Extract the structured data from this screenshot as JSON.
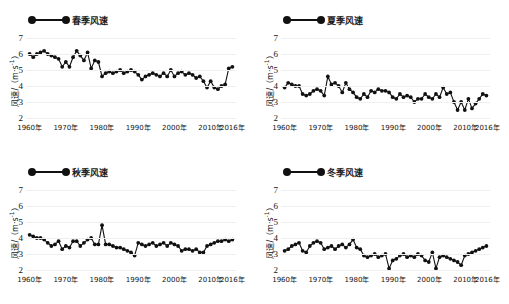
{
  "figure": {
    "background": "#ffffff",
    "series_color": "#111111",
    "panel_count": 4
  },
  "axis": {
    "ylabel": "风速/（m·s",
    "ylabel_sup": "-1",
    "ylabel_tail": "）",
    "yticks": [
      "7",
      "6",
      "5",
      "4",
      "3",
      "2"
    ],
    "ylim": [
      2,
      7
    ],
    "xticks": [
      "1960年",
      "1970年",
      "1980年",
      "1990年",
      "2000年",
      "2010年",
      "2016年"
    ],
    "xtick_values": [
      1960,
      1970,
      1980,
      1990,
      2000,
      2010,
      2016
    ],
    "xlim": [
      1959,
      2017
    ]
  },
  "panels": [
    {
      "id": "spring",
      "legend": "春季风速"
    },
    {
      "id": "summer",
      "legend": "夏季风速"
    },
    {
      "id": "autumn",
      "legend": "秋季风速"
    },
    {
      "id": "winter",
      "legend": "冬季风速"
    }
  ],
  "chart_data": [
    {
      "type": "line",
      "title": "春季风速",
      "xlabel": "",
      "ylabel": "风速/（m·s-1）",
      "ylim": [
        2,
        7
      ],
      "xlim": [
        1959,
        2017
      ],
      "grid": true,
      "legend": "春季风速",
      "marker": "filled-circle",
      "x": [
        1960,
        1961,
        1962,
        1963,
        1964,
        1965,
        1966,
        1967,
        1968,
        1969,
        1970,
        1971,
        1972,
        1973,
        1974,
        1975,
        1976,
        1977,
        1978,
        1979,
        1980,
        1981,
        1982,
        1983,
        1984,
        1985,
        1986,
        1987,
        1988,
        1989,
        1990,
        1991,
        1992,
        1993,
        1994,
        1995,
        1996,
        1997,
        1998,
        1999,
        2000,
        2001,
        2002,
        2003,
        2004,
        2005,
        2006,
        2007,
        2008,
        2009,
        2010,
        2011,
        2012,
        2013,
        2014,
        2015,
        2016
      ],
      "values": [
        6.0,
        5.8,
        6.0,
        6.1,
        6.2,
        6.0,
        5.9,
        5.8,
        5.7,
        5.2,
        5.5,
        5.2,
        5.8,
        6.2,
        5.9,
        5.6,
        6.1,
        5.1,
        5.6,
        5.5,
        4.6,
        4.8,
        4.9,
        4.8,
        4.9,
        5.0,
        4.8,
        4.9,
        5.0,
        4.9,
        4.7,
        4.4,
        4.6,
        4.7,
        4.8,
        4.7,
        4.6,
        4.8,
        4.6,
        5.0,
        4.6,
        4.8,
        4.9,
        4.7,
        4.8,
        4.7,
        4.5,
        4.6,
        4.3,
        3.9,
        4.3,
        3.9,
        3.8,
        4.0,
        4.1,
        5.1,
        5.2
      ]
    },
    {
      "type": "line",
      "title": "夏季风速",
      "xlabel": "",
      "ylabel": "风速/（m·s-1）",
      "ylim": [
        2,
        7
      ],
      "xlim": [
        1959,
        2017
      ],
      "grid": true,
      "legend": "夏季风速",
      "marker": "filled-circle",
      "x": [
        1960,
        1961,
        1962,
        1963,
        1964,
        1965,
        1966,
        1967,
        1968,
        1969,
        1970,
        1971,
        1972,
        1973,
        1974,
        1975,
        1976,
        1977,
        1978,
        1979,
        1980,
        1981,
        1982,
        1983,
        1984,
        1985,
        1986,
        1987,
        1988,
        1989,
        1990,
        1991,
        1992,
        1993,
        1994,
        1995,
        1996,
        1997,
        1998,
        1999,
        2000,
        2001,
        2002,
        2003,
        2004,
        2005,
        2006,
        2007,
        2008,
        2009,
        2010,
        2011,
        2012,
        2013,
        2014,
        2015,
        2016
      ],
      "values": [
        3.9,
        4.2,
        4.1,
        4.0,
        4.0,
        3.5,
        3.4,
        3.5,
        3.7,
        3.8,
        3.7,
        3.4,
        4.6,
        4.1,
        4.2,
        4.0,
        3.6,
        4.2,
        3.8,
        3.6,
        3.3,
        3.2,
        3.5,
        3.3,
        3.7,
        3.6,
        3.8,
        3.7,
        3.7,
        3.6,
        3.3,
        3.2,
        3.5,
        3.3,
        3.4,
        3.3,
        3.0,
        3.2,
        3.2,
        3.5,
        3.3,
        3.2,
        3.5,
        3.3,
        3.9,
        3.5,
        3.6,
        3.0,
        2.5,
        3.0,
        2.5,
        3.2,
        2.6,
        2.9,
        3.2,
        3.5,
        3.4
      ]
    },
    {
      "type": "line",
      "title": "秋季风速",
      "xlabel": "",
      "ylabel": "风速/（m·s-1）",
      "ylim": [
        2,
        7
      ],
      "xlim": [
        1959,
        2017
      ],
      "grid": true,
      "legend": "秋季风速",
      "marker": "filled-circle",
      "x": [
        1960,
        1961,
        1962,
        1963,
        1964,
        1965,
        1966,
        1967,
        1968,
        1969,
        1970,
        1971,
        1972,
        1973,
        1974,
        1975,
        1976,
        1977,
        1978,
        1979,
        1980,
        1981,
        1982,
        1983,
        1984,
        1985,
        1986,
        1987,
        1988,
        1989,
        1990,
        1991,
        1992,
        1993,
        1994,
        1995,
        1996,
        1997,
        1998,
        1999,
        2000,
        2001,
        2002,
        2003,
        2004,
        2005,
        2006,
        2007,
        2008,
        2009,
        2010,
        2011,
        2012,
        2013,
        2014,
        2015,
        2016
      ],
      "values": [
        4.2,
        4.1,
        4.0,
        4.0,
        3.9,
        3.7,
        3.5,
        3.6,
        3.8,
        3.3,
        3.5,
        3.4,
        3.8,
        3.8,
        3.5,
        3.7,
        3.9,
        4.0,
        3.6,
        3.6,
        4.8,
        3.6,
        3.6,
        3.5,
        3.4,
        3.4,
        3.3,
        3.2,
        3.1,
        2.9,
        3.7,
        3.6,
        3.5,
        3.6,
        3.7,
        3.5,
        3.6,
        3.7,
        3.5,
        3.7,
        3.6,
        3.5,
        3.2,
        3.3,
        3.3,
        3.2,
        3.3,
        3.1,
        3.1,
        3.5,
        3.6,
        3.7,
        3.8,
        3.8,
        3.9,
        3.8,
        3.9
      ]
    },
    {
      "type": "line",
      "title": "冬季风速",
      "xlabel": "",
      "ylabel": "风速/（m·s-1）",
      "ylim": [
        2,
        7
      ],
      "xlim": [
        1959,
        2017
      ],
      "grid": true,
      "legend": "冬季风速",
      "marker": "filled-circle",
      "x": [
        1960,
        1961,
        1962,
        1963,
        1964,
        1965,
        1966,
        1967,
        1968,
        1969,
        1970,
        1971,
        1972,
        1973,
        1974,
        1975,
        1976,
        1977,
        1978,
        1979,
        1980,
        1981,
        1982,
        1983,
        1984,
        1985,
        1986,
        1987,
        1988,
        1989,
        1990,
        1991,
        1992,
        1993,
        1994,
        1995,
        1996,
        1997,
        1998,
        1999,
        2000,
        2001,
        2002,
        2003,
        2004,
        2005,
        2006,
        2007,
        2008,
        2009,
        2010,
        2011,
        2012,
        2013,
        2014,
        2015,
        2016
      ],
      "values": [
        3.2,
        3.3,
        3.5,
        3.6,
        3.7,
        3.2,
        3.1,
        3.5,
        3.7,
        3.8,
        3.7,
        3.3,
        3.4,
        3.5,
        3.3,
        3.5,
        3.6,
        3.4,
        3.6,
        3.9,
        3.4,
        3.3,
        2.9,
        2.8,
        2.9,
        3.0,
        2.8,
        2.9,
        3.0,
        2.1,
        2.6,
        2.7,
        2.9,
        3.0,
        2.8,
        2.9,
        2.8,
        3.0,
        2.9,
        2.6,
        2.5,
        3.1,
        2.1,
        2.8,
        2.9,
        2.8,
        2.7,
        2.6,
        2.5,
        2.3,
        2.9,
        3.0,
        3.1,
        3.2,
        3.3,
        3.4,
        3.5
      ]
    }
  ]
}
